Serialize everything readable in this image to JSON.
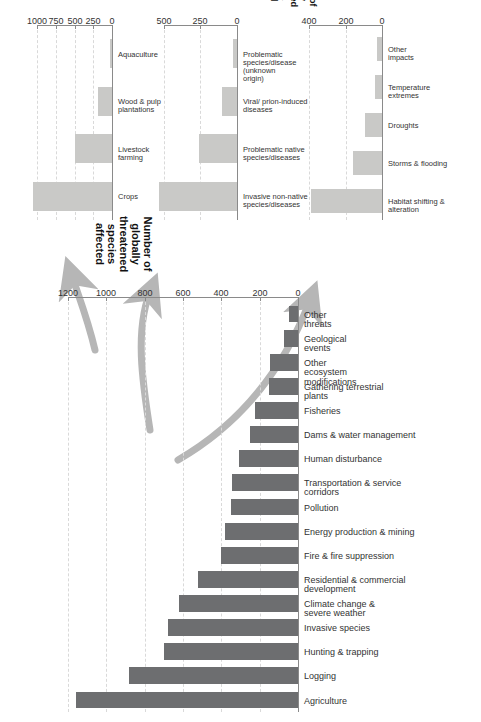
{
  "figure": {
    "background": "#ffffff",
    "main_bar_color": "#6d6e70",
    "inset_bar_color": "#c9c9c7",
    "arrow_color": "#b6b6b6",
    "orientation": "rotated-90-ccw",
    "caption": ""
  },
  "chart_data": [
    {
      "id": "main",
      "type": "bar",
      "title": "",
      "xlabel": "",
      "ylabel": "Number of globally threatened species affected",
      "ylim": [
        0,
        1200
      ],
      "ticks": [
        0,
        200,
        400,
        600,
        800,
        1000,
        1200
      ],
      "grid": true,
      "categories": [
        "Agriculture",
        "Logging",
        "Hunting & trapping",
        "Invasive species",
        "Climate change &\nsevere weather",
        "Residential & commercial\ndevelopment",
        "Fire & fire suppression",
        "Energy production & mining",
        "Pollution",
        "Transportation & service\ncorridors",
        "Human disturbance",
        "Dams & water management",
        "Fisheries",
        "Gathering terrestrial plants",
        "Other ecosystem\nmodifications",
        "Geological events",
        "Other threats"
      ],
      "values": [
        1160,
        880,
        700,
        680,
        620,
        520,
        400,
        380,
        350,
        345,
        310,
        250,
        225,
        150,
        145,
        75,
        45
      ]
    },
    {
      "id": "inset-agriculture",
      "type": "bar",
      "title": "",
      "xlabel": "",
      "ylabel": "",
      "ylim": [
        0,
        1100
      ],
      "ticks": [
        0,
        250,
        500,
        750,
        1000
      ],
      "grid": true,
      "categories": [
        "Crops",
        "Livestock\nfarming",
        "Wood & pulp\nplantations",
        "Aquaculture"
      ],
      "values": [
        1060,
        500,
        190,
        30
      ]
    },
    {
      "id": "inset-invasive-species",
      "type": "bar",
      "title": "",
      "xlabel": "",
      "ylabel": "",
      "ylim": [
        0,
        560
      ],
      "ticks": [
        0,
        250,
        500
      ],
      "grid": true,
      "categories": [
        "Invasive non-native\nspecies/diseases",
        "Problematic native\nspecies/diseases",
        "Viral/ prion-induced\ndiseases",
        "Problematic\nspecies/disease\n(unknown origin)"
      ],
      "values": [
        530,
        260,
        100,
        30
      ]
    },
    {
      "id": "inset-climate-change",
      "type": "bar",
      "title": "",
      "xlabel": "",
      "ylabel": "Number of globally\nthreatened species\naffected",
      "ylim": [
        0,
        450
      ],
      "ticks": [
        0,
        200,
        400
      ],
      "grid": true,
      "categories": [
        "Habitat shifting &\nalteration",
        "Storms & flooding",
        "Droughts",
        "Temperature extremes",
        "Other impacts"
      ],
      "values": [
        390,
        160,
        95,
        38,
        30
      ]
    }
  ],
  "main_chart": {
    "axis_title": "Number of globally threatened species affected"
  },
  "inset_agriculture": {
    "axis_title": ""
  },
  "inset_invasive": {
    "axis_title": ""
  },
  "inset_climate": {
    "axis_title": "Number of globally\nthreatened species\naffected"
  }
}
